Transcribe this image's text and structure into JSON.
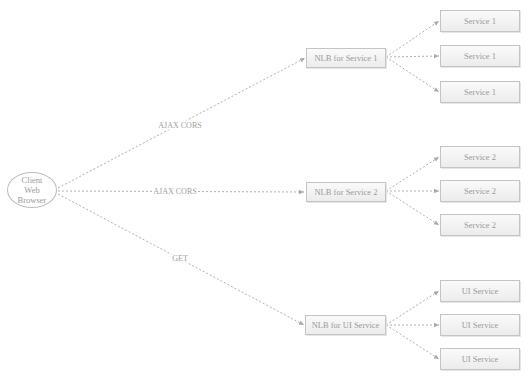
{
  "diagram": {
    "client": {
      "lines": [
        "Client",
        "Web",
        "Browser"
      ]
    },
    "edge_labels": {
      "to_nlb1": "AJAX CORS",
      "to_nlb2": "AJAX CORS",
      "to_nlb_ui": "GET"
    },
    "load_balancers": [
      {
        "label": "NLB for Service 1",
        "services": [
          "Service 1",
          "Service 1",
          "Service 1"
        ]
      },
      {
        "label": "NLB for Service 2",
        "services": [
          "Service 2",
          "Service 2",
          "Service 2"
        ]
      },
      {
        "label": "NLB for UI Service",
        "services": [
          "UI Service",
          "UI Service",
          "UI Service"
        ]
      }
    ],
    "colors": {
      "edge": "#b0b0b0",
      "node_border": "#c4c4c4",
      "text": "#9a9a9a"
    }
  }
}
